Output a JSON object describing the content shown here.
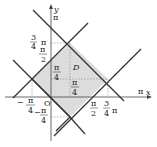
{
  "diagram": {
    "region_label": "D",
    "axis_x_label": "x",
    "axis_y_label": "y",
    "origin_label": "O",
    "colors": {
      "region_fill": "#dcdcdc",
      "line": "#333333",
      "axis": "#444444",
      "dashed": "#888888"
    },
    "ticks": {
      "y_pi": "π",
      "y_3_4_num": "3",
      "y_3_4_den": "4",
      "y_3_4_pi": "π",
      "y_half_num": "π",
      "y_half_den": "2",
      "x_pi": "π",
      "x_half_num": "π",
      "x_half_den": "2",
      "x_3_4_num": "3",
      "x_3_4_den": "4",
      "x_3_4_pi": "π",
      "neg_x_quarter_num": "π",
      "neg_x_quarter_den": "4",
      "neg_y_quarter_num": "π",
      "neg_y_quarter_den": "4",
      "inner_quarter_y_num": "π",
      "inner_quarter_y_den": "4",
      "inner_quarter_x_num": "π",
      "inner_quarter_x_den": "4",
      "minus": "−"
    }
  }
}
